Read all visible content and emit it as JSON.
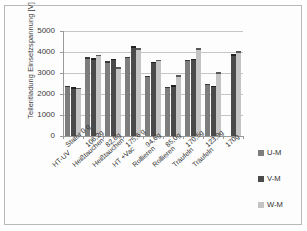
{
  "chart_data": {
    "type": "bar",
    "title": "",
    "subtitle": "",
    "xlabel": "",
    "ylabel": "Teilentladung Einsetzspannung [V]",
    "ylim": [
      0,
      5000
    ],
    "yticks": [
      0,
      1000,
      2000,
      3000,
      4000,
      5000
    ],
    "ytick_labels": [
      "0",
      "1000",
      "2000",
      "3000",
      "4000",
      "5000"
    ],
    "grid": "horizontal",
    "legend_position": "right",
    "categories": [
      "Stator 0 g",
      "106,2g",
      "82,8g",
      "175,6 g",
      "94,6g",
      "85,0g",
      "170,5g",
      "123,9g",
      "170g"
    ],
    "categories_line2": [
      "HT-UV",
      "Heißtauchen",
      "Heißtauchen",
      "HT +Vac",
      "Rollieren",
      "Rollieren",
      "Träufeln",
      "Träufeln",
      ""
    ],
    "series": [
      {
        "name": "U-M",
        "color": "#7d7d7d",
        "values": [
          2400,
          3750,
          3560,
          3780,
          2870,
          2350,
          3640,
          2480,
          null
        ]
      },
      {
        "name": "V-M",
        "color": "#4a4a4a",
        "values": [
          2330,
          3700,
          3680,
          4280,
          3540,
          2420,
          3680,
          2400,
          3900
        ]
      },
      {
        "name": "W-M",
        "color": "#c4c4c4",
        "values": [
          2300,
          3880,
          3280,
          4180,
          3620,
          2900,
          4170,
          3040,
          4030
        ]
      }
    ]
  },
  "legend": {
    "items": [
      {
        "label": "U-M",
        "color": "#7d7d7d"
      },
      {
        "label": "V-M",
        "color": "#4a4a4a"
      },
      {
        "label": "W-M",
        "color": "#c4c4c4"
      }
    ]
  }
}
